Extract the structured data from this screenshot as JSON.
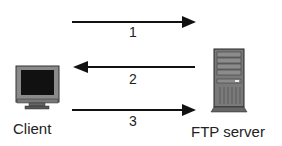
{
  "diagram": {
    "nodes": [
      {
        "id": "client",
        "label": "Client",
        "icon": "monitor-icon"
      },
      {
        "id": "server",
        "label": "FTP server",
        "icon": "server-tower-icon"
      }
    ],
    "edges": [
      {
        "label": "1",
        "from": "client",
        "to": "server"
      },
      {
        "label": "2",
        "from": "server",
        "to": "client"
      },
      {
        "label": "3",
        "from": "client",
        "to": "server"
      }
    ]
  }
}
